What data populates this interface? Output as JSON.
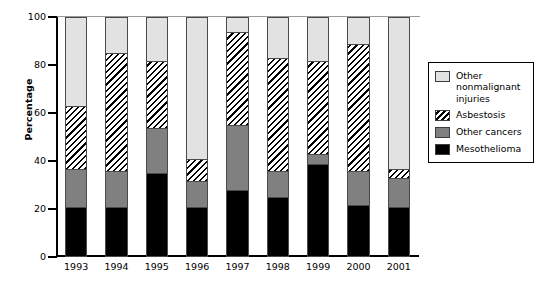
{
  "chart_data": {
    "type": "bar",
    "subtype": "stacked-100-percent",
    "title": "",
    "xlabel": "",
    "ylabel": "Percentage",
    "ylim": [
      0,
      100
    ],
    "yticks": [
      0,
      20,
      40,
      60,
      80,
      100
    ],
    "grid": false,
    "legend_position": "right",
    "categories": [
      "1993",
      "1994",
      "1995",
      "1996",
      "1997",
      "1998",
      "1999",
      "2000",
      "2001"
    ],
    "series": [
      {
        "name": "Mesothelioma",
        "swatch": "solid-black",
        "color": "#000000",
        "values": [
          20,
          20,
          34,
          20,
          27,
          24,
          38,
          21,
          20
        ]
      },
      {
        "name": "Other cancers",
        "swatch": "solid-gray",
        "color": "#808080",
        "values": [
          16,
          15,
          19,
          11,
          27,
          11,
          4,
          14,
          12
        ]
      },
      {
        "name": "Asbestosis",
        "swatch": "diagonal-hatch",
        "color": "#000000",
        "values": [
          26,
          49,
          28,
          9,
          39,
          47,
          39,
          53,
          4
        ]
      },
      {
        "name": "Other nonmalignant injuries",
        "swatch": "solid-light-gray",
        "color": "#e2e2e2",
        "values": [
          38,
          16,
          19,
          60,
          7,
          18,
          19,
          12,
          64
        ]
      }
    ],
    "cumulative_tops": {
      "1993": [
        20,
        36,
        62,
        100
      ],
      "1994": [
        20,
        35,
        84,
        100
      ],
      "1995": [
        34,
        53,
        81,
        100
      ],
      "1996": [
        20,
        31,
        40,
        100
      ],
      "1997": [
        27,
        54,
        93,
        100
      ],
      "1998": [
        24,
        35,
        82,
        100
      ],
      "1999": [
        38,
        42,
        81,
        100
      ],
      "2000": [
        21,
        35,
        88,
        100
      ],
      "2001": [
        20,
        32,
        36,
        100
      ]
    }
  },
  "axes": {
    "y_title": "Percentage",
    "y_tick_labels": [
      "100",
      "80",
      "60",
      "40",
      "20",
      "0"
    ],
    "x_tick_labels": [
      "1993",
      "1994",
      "1995",
      "1996",
      "1997",
      "1998",
      "1999",
      "2000",
      "2001"
    ]
  },
  "legend": {
    "items": [
      {
        "label": "Other nonmalignant injuries",
        "swatch": "solid-light-gray"
      },
      {
        "label": "Asbestosis",
        "swatch": "diagonal-hatch"
      },
      {
        "label": "Other cancers",
        "swatch": "solid-gray"
      },
      {
        "label": "Mesothelioma",
        "swatch": "solid-black"
      }
    ]
  },
  "colors": {
    "other_nonmalignant": "#e2e2e2",
    "asbestosis": "#000000",
    "other_cancers": "#808080",
    "mesothelioma": "#000000",
    "axis": "#000000"
  }
}
